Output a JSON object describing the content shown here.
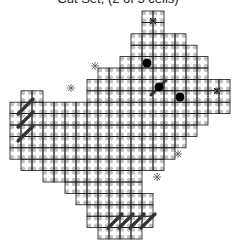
{
  "title": "Cut Set; (2 of 3 cells)",
  "grid": {
    "origin_x": 10,
    "origin_y": 11,
    "cell_w": 11,
    "cell_h": 11.4,
    "line_color": "#1a1a1a",
    "dot_color": "#a8a8a8",
    "rows": [
      [
        [
          12,
          13
        ]
      ],
      [
        [
          12,
          13
        ]
      ],
      [
        [
          11,
          15
        ]
      ],
      [
        [
          11,
          16
        ]
      ],
      [
        [
          10,
          17
        ]
      ],
      [
        [
          8,
          17
        ]
      ],
      [
        [
          7,
          19
        ]
      ],
      [
        [
          1,
          2
        ],
        [
          7,
          19
        ]
      ],
      [
        [
          0,
          19
        ]
      ],
      [
        [
          0,
          17
        ]
      ],
      [
        [
          0,
          16
        ]
      ],
      [
        [
          0,
          15
        ]
      ],
      [
        [
          0,
          14
        ]
      ],
      [
        [
          1,
          13
        ]
      ],
      [
        [
          3,
          11
        ]
      ],
      [
        [
          5,
          11
        ]
      ],
      [
        [
          6,
          12
        ]
      ],
      [
        [
          7,
          12
        ]
      ],
      [
        [
          7,
          12
        ]
      ],
      [
        [
          8,
          11
        ]
      ]
    ]
  },
  "markers": {
    "big_dots": [
      [
        147,
        63
      ],
      [
        159,
        87
      ],
      [
        180,
        97
      ]
    ],
    "small_cross_markers": [
      [
        153,
        21
      ],
      [
        217,
        91
      ]
    ],
    "asterisks": [
      [
        95,
        66
      ],
      [
        71,
        88
      ],
      [
        178,
        154
      ],
      [
        157,
        177
      ]
    ],
    "diag_dashes": [
      [
        [
          151,
          95
        ],
        [
          167,
          79
        ]
      ]
    ],
    "left_hatch": [
      [
        [
          18,
          114
        ],
        [
          33,
          99
        ]
      ],
      [
        [
          18,
          127
        ],
        [
          33,
          112
        ]
      ],
      [
        [
          18,
          141
        ],
        [
          33,
          126
        ]
      ]
    ],
    "bottom_hatch": [
      [
        [
          108,
          228
        ],
        [
          122,
          214
        ]
      ],
      [
        [
          119,
          228
        ],
        [
          133,
          214
        ]
      ],
      [
        [
          130,
          228
        ],
        [
          144,
          214
        ]
      ],
      [
        [
          141,
          228
        ],
        [
          155,
          214
        ]
      ]
    ]
  }
}
